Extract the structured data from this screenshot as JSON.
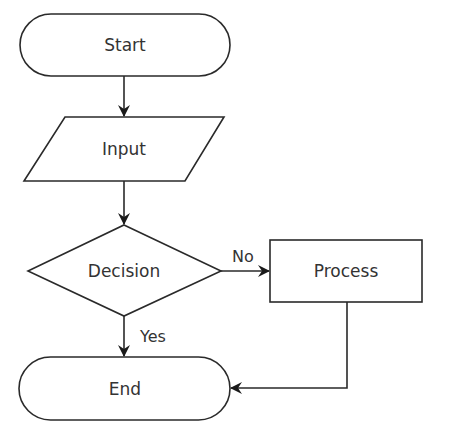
{
  "diagram": {
    "type": "flowchart",
    "colors": {
      "stroke": "#2a2a2a",
      "text": "#333333",
      "background": "#ffffff"
    },
    "nodes": [
      {
        "id": "start",
        "shape": "terminator",
        "label": "Start"
      },
      {
        "id": "input",
        "shape": "parallelogram",
        "label": "Input"
      },
      {
        "id": "decision",
        "shape": "diamond",
        "label": "Decision"
      },
      {
        "id": "process",
        "shape": "rectangle",
        "label": "Process"
      },
      {
        "id": "end",
        "shape": "terminator",
        "label": "End"
      }
    ],
    "edges": [
      {
        "from": "start",
        "to": "input",
        "label": ""
      },
      {
        "from": "input",
        "to": "decision",
        "label": ""
      },
      {
        "from": "decision",
        "to": "process",
        "label": "No"
      },
      {
        "from": "decision",
        "to": "end",
        "label": "Yes"
      },
      {
        "from": "process",
        "to": "end",
        "label": ""
      }
    ]
  }
}
